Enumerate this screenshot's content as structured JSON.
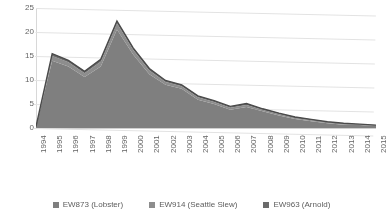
{
  "chart_data": {
    "type": "area",
    "stacked": true,
    "title": "",
    "xlabel": "",
    "ylabel": "Production (MMstb)",
    "ylim": [
      0,
      25
    ],
    "yticks": [
      0,
      5,
      10,
      15,
      20,
      25
    ],
    "grid": true,
    "legend_position": "bottom",
    "categories": [
      "1994",
      "1995",
      "1996",
      "1997",
      "1998",
      "1999",
      "2000",
      "2001",
      "2002",
      "2003",
      "2004",
      "2005",
      "2006",
      "2007",
      "2008",
      "2009",
      "2010",
      "2011",
      "2012",
      "2013",
      "2014",
      "2015"
    ],
    "series": [
      {
        "name": "EW873 (Lobster)",
        "color": "#7f7f7f",
        "values": [
          0.3,
          14.0,
          12.8,
          10.6,
          12.8,
          20.5,
          15.3,
          11.2,
          9.0,
          8.2,
          5.9,
          5.0,
          3.8,
          4.4,
          3.5,
          2.6,
          1.9,
          1.4,
          1.0,
          0.7,
          0.6,
          0.4
        ]
      },
      {
        "name": "EW914 (Seattle Slew)",
        "color": "#8d8d8d",
        "values": [
          0.0,
          1.0,
          0.9,
          0.8,
          1.0,
          1.3,
          1.0,
          0.8,
          0.6,
          0.5,
          0.5,
          0.4,
          0.4,
          0.4,
          0.3,
          0.3,
          0.2,
          0.2,
          0.2,
          0.2,
          0.1,
          0.1
        ]
      },
      {
        "name": "EW963 (Arnold)",
        "color": "#6b6b6b",
        "values": [
          0.0,
          0.5,
          0.4,
          0.4,
          0.5,
          0.5,
          0.4,
          0.4,
          0.3,
          0.3,
          0.3,
          0.3,
          0.3,
          0.3,
          0.2,
          0.2,
          0.2,
          0.2,
          0.1,
          0.1,
          0.1,
          0.1
        ]
      }
    ],
    "totals": [
      0.3,
      15.5,
      14.1,
      11.8,
      14.3,
      22.3,
      16.7,
      12.4,
      9.9,
      9.0,
      6.7,
      5.7,
      4.5,
      5.1,
      4.0,
      3.1,
      2.3,
      1.8,
      1.3,
      1.0,
      0.8,
      0.6
    ]
  },
  "legend": {
    "items": [
      {
        "label": "EW873 (Lobster)",
        "color": "#7f7f7f"
      },
      {
        "label": "EW914 (Seattle Slew)",
        "color": "#8d8d8d"
      },
      {
        "label": "EW963 (Arnold)",
        "color": "#6b6b6b"
      }
    ]
  }
}
